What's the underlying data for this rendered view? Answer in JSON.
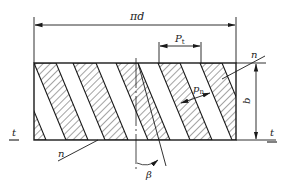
{
  "diagram": {
    "type": "helical-gear-tooth-development",
    "colors": {
      "stroke": "#1a1a1a",
      "hatch": "#333333",
      "background": "#ffffff"
    },
    "labels": {
      "circumference": "πd",
      "transverse_pitch": "P",
      "transverse_pitch_sub": "t",
      "normal_pitch": "p",
      "normal_pitch_sub": "n",
      "face_width": "b",
      "normal_section_top": "n",
      "normal_section_bottom": "n",
      "transverse_section_left": "t",
      "transverse_section_right": "t",
      "helix_angle": "β"
    }
  }
}
